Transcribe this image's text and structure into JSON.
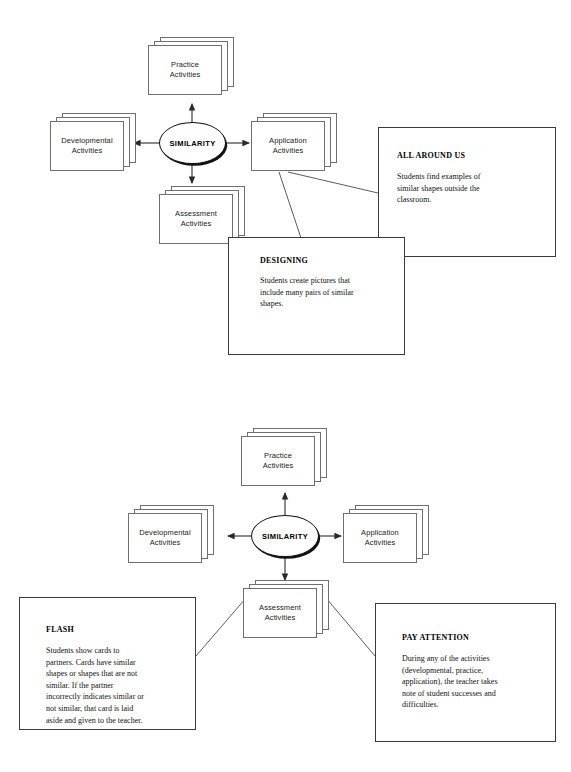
{
  "page": {
    "background_color": "#ffffff",
    "line_color": "#6f6f6f",
    "hub_color": "#111111"
  },
  "diagrams": [
    {
      "id": "similarity-web-top",
      "hub": {
        "label": "SIMILARITY"
      },
      "cards": [
        {
          "id": "practice",
          "label": "Practice\nActivities"
        },
        {
          "id": "developmental",
          "label": "Developmental\nActivities"
        },
        {
          "id": "application",
          "label": "Application\nActivities"
        },
        {
          "id": "assessment",
          "label": "Assessment\nActivities"
        }
      ],
      "notes": [
        {
          "id": "all-around-us",
          "title": "ALL AROUND US",
          "body": "Students find examples of\nsimilar shapes outside the\nclassroom."
        },
        {
          "id": "designing",
          "title": "DESIGNING",
          "body": "Students create pictures that\ninclude many pairs of similar\nshapes."
        }
      ]
    },
    {
      "id": "similarity-web-bottom",
      "hub": {
        "label": "SIMILARITY"
      },
      "cards": [
        {
          "id": "practice",
          "label": "Practice\nActivities"
        },
        {
          "id": "developmental",
          "label": "Developmental\nActivities"
        },
        {
          "id": "application",
          "label": "Application\nActivities"
        },
        {
          "id": "assessment",
          "label": "Assessment\nActivities"
        }
      ],
      "notes": [
        {
          "id": "flash",
          "title": "FLASH",
          "body": "Students show cards to\npartners. Cards have similar\nshapes or shapes that are not\nsimilar. If the partner\nincorrectly indicates similar or\nnot similar, that card is laid\naside and given to the teacher."
        },
        {
          "id": "pay-attention",
          "title": "PAY ATTENTION",
          "body": "During any of the activities\n(developmental, practice,\napplication), the teacher takes\nnote of student successes and\ndifficulties."
        }
      ]
    }
  ]
}
